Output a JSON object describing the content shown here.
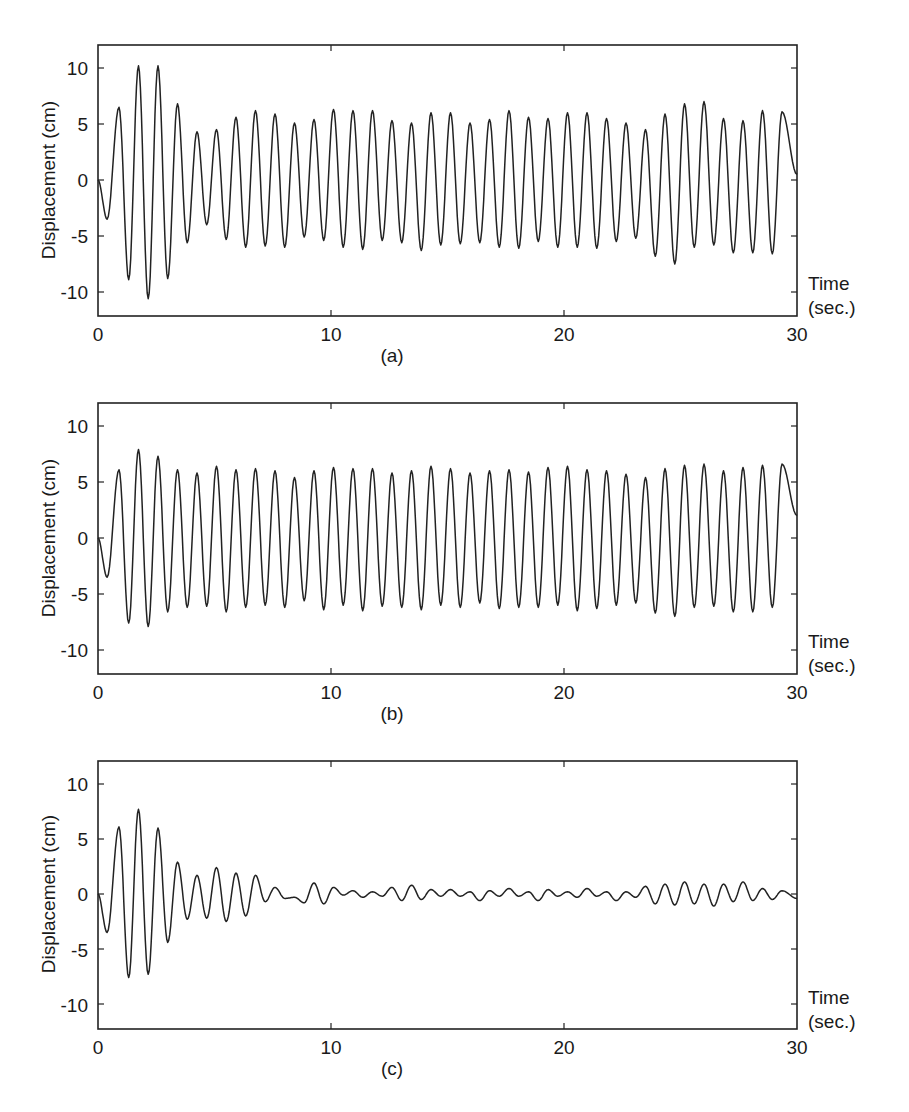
{
  "chart_data": [
    {
      "type": "line",
      "panel": "(a)",
      "title": "",
      "xlabel": "Time (sec.)",
      "ylabel": "Displacement (cm)",
      "xlim": [
        0,
        30
      ],
      "ylim": [
        -12,
        12
      ],
      "xticks": [
        0,
        10,
        20,
        30
      ],
      "yticks": [
        10,
        5,
        0,
        -5,
        -10
      ],
      "grid": false,
      "series": [
        {
          "name": "displacement",
          "first_trough": {
            "t": 0.39,
            "value": -3.5
          },
          "first_peak_t": 0.9,
          "period": 0.837,
          "peaks": [
            6.5,
            10.2,
            10.2,
            6.8,
            4.3,
            4.5,
            5.6,
            6.2,
            5.9,
            5.1,
            5.4,
            6.3,
            6.2,
            6.2,
            5.3,
            5.1,
            6.0,
            6.0,
            5.1,
            5.4,
            6.2,
            5.6,
            5.5,
            6.0,
            6.0,
            5.5,
            5.1,
            4.5,
            5.9,
            6.8,
            7.0,
            5.5,
            5.3,
            6.2,
            6.1
          ],
          "troughs": [
            -8.9,
            -10.6,
            -8.8,
            -5.6,
            -4.0,
            -5.3,
            -6.0,
            -5.9,
            -6.0,
            -5.1,
            -5.4,
            -6.0,
            -6.2,
            -5.4,
            -5.6,
            -6.3,
            -5.8,
            -5.7,
            -5.6,
            -6.0,
            -6.1,
            -5.5,
            -6.0,
            -6.0,
            -6.1,
            -5.5,
            -5.2,
            -6.8,
            -7.5,
            -6.0,
            -5.8,
            -6.5,
            -6.5,
            -6.6
          ],
          "end_value": 0.5
        }
      ]
    },
    {
      "type": "line",
      "panel": "(b)",
      "title": "",
      "xlabel": "Time (sec.)",
      "ylabel": "Displacement (cm)",
      "xlim": [
        0,
        30
      ],
      "ylim": [
        -12,
        12
      ],
      "xticks": [
        0,
        10,
        20,
        30
      ],
      "yticks": [
        10,
        5,
        0,
        -5,
        -10
      ],
      "grid": false,
      "series": [
        {
          "name": "displacement",
          "first_trough": {
            "t": 0.39,
            "value": -3.5
          },
          "first_peak_t": 0.9,
          "period": 0.837,
          "peaks": [
            6.1,
            7.9,
            7.3,
            6.1,
            5.8,
            6.4,
            6.1,
            6.2,
            6.0,
            5.4,
            6.0,
            6.3,
            6.2,
            6.2,
            5.8,
            6.0,
            6.4,
            6.2,
            5.8,
            6.0,
            6.1,
            5.9,
            6.3,
            6.4,
            6.1,
            6.0,
            5.7,
            5.4,
            6.2,
            6.5,
            6.6,
            6.0,
            6.3,
            6.5,
            6.6
          ],
          "troughs": [
            -7.6,
            -7.9,
            -6.6,
            -6.2,
            -6.1,
            -6.6,
            -6.2,
            -6.0,
            -6.2,
            -5.6,
            -6.4,
            -6.0,
            -6.5,
            -6.1,
            -6.2,
            -6.4,
            -6.0,
            -6.2,
            -5.8,
            -6.3,
            -6.2,
            -6.2,
            -6.0,
            -6.5,
            -6.3,
            -6.0,
            -5.8,
            -6.7,
            -7.0,
            -6.2,
            -6.1,
            -6.6,
            -6.6,
            -6.2
          ],
          "end_value": 2.0
        }
      ]
    },
    {
      "type": "line",
      "panel": "(c)",
      "title": "",
      "xlabel": "Time (sec.)",
      "ylabel": "Displacement (cm)",
      "xlim": [
        0,
        30
      ],
      "ylim": [
        -12,
        12
      ],
      "xticks": [
        0,
        10,
        20,
        30
      ],
      "yticks": [
        10,
        5,
        0,
        -5,
        -10
      ],
      "grid": false,
      "series": [
        {
          "name": "displacement",
          "first_trough": {
            "t": 0.39,
            "value": -3.5
          },
          "first_peak_t": 0.9,
          "period": 0.837,
          "peaks": [
            6.1,
            7.7,
            6.0,
            2.9,
            1.7,
            2.4,
            1.9,
            1.7,
            0.6,
            -0.3,
            1.0,
            0.6,
            0.3,
            0.2,
            0.6,
            0.8,
            0.4,
            0.4,
            0.2,
            0.3,
            0.5,
            0.2,
            0.4,
            0.2,
            0.5,
            0.2,
            0.2,
            0.7,
            0.9,
            1.1,
            0.9,
            0.9,
            1.1,
            0.5,
            0.3
          ],
          "troughs": [
            -7.6,
            -7.3,
            -4.4,
            -2.3,
            -2.2,
            -2.5,
            -2.0,
            -0.7,
            -0.4,
            -0.8,
            -0.9,
            -0.1,
            -0.3,
            -0.2,
            -0.6,
            -0.5,
            -0.2,
            -0.2,
            -0.6,
            -0.2,
            -0.2,
            -0.6,
            -0.2,
            -0.3,
            -0.2,
            -0.6,
            -0.3,
            -0.9,
            -1.0,
            -0.9,
            -1.1,
            -0.7,
            -0.6,
            -0.5
          ],
          "end_value": -0.4
        }
      ]
    }
  ],
  "panels": [
    {
      "label": "(a)",
      "xlabel_line1": "Time",
      "xlabel_line2": "(sec.)",
      "ylabel": "Displacement (cm)",
      "xtick_labels": [
        "0",
        "10",
        "20",
        "30"
      ],
      "ytick_labels": [
        "10",
        "5",
        "0",
        "-5",
        "-10"
      ]
    },
    {
      "label": "(b)",
      "xlabel_line1": "Time",
      "xlabel_line2": "(sec.)",
      "ylabel": "Displacement (cm)",
      "xtick_labels": [
        "0",
        "10",
        "20",
        "30"
      ],
      "ytick_labels": [
        "10",
        "5",
        "0",
        "-5",
        "-10"
      ]
    },
    {
      "label": "(c)",
      "xlabel_line1": "Time",
      "xlabel_line2": "(sec.)",
      "ylabel": "Displacement (cm)",
      "xtick_labels": [
        "0",
        "10",
        "20",
        "30"
      ],
      "ytick_labels": [
        "10",
        "5",
        "0",
        "-5",
        "-10"
      ]
    }
  ],
  "colors": {
    "line": "#222222",
    "background": "#ffffff",
    "text": "#1a1a1a"
  }
}
